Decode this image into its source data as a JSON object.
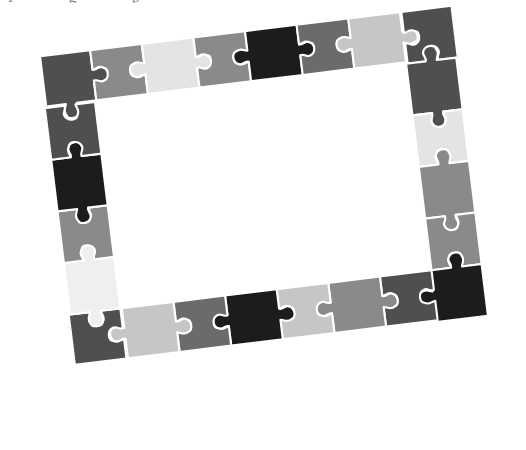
{
  "artwork": {
    "title": "Jigsaw Puzzle Picture Frame",
    "description": "A rectangular picture frame assembled from interlocking jigsaw puzzle pieces, tilted slightly counter-clockwise, rendered in grayscale on a white background with an empty white center.",
    "background_color": "#ffffff",
    "rotation_degrees": -7,
    "piece_outline_color": "#ffffff"
  },
  "page_text": {
    "cut_off_line": "I  g  p"
  },
  "palette": {
    "black": "#1c1c1c",
    "very_dark_gray": "#3a3a3a",
    "dark_gray": "#4f4f4f",
    "mid_dark_gray": "#6b6b6b",
    "mid_gray": "#8a8a8a",
    "light_mid_gray": "#a8a8a8",
    "light_gray": "#c6c6c6",
    "very_light_gray": "#e4e4e4",
    "near_white": "#efefef"
  },
  "frame": {
    "geometry": {
      "columns": 8,
      "rows": 6,
      "piece_size_px": 52,
      "origin_x": 56,
      "origin_y": 30,
      "center_hole": "empty white interior"
    },
    "edges": {
      "top": {
        "label": "Top edge",
        "piece_count": 8,
        "colors": [
          "#4f4f4f",
          "#8a8a8a",
          "#e4e4e4",
          "#8a8a8a",
          "#1c1c1c",
          "#6b6b6b",
          "#c6c6c6",
          "#4f4f4f"
        ]
      },
      "right": {
        "label": "Right edge",
        "piece_count": 6,
        "colors": [
          "#4f4f4f",
          "#e4e4e4",
          "#8a8a8a",
          "#8a8a8a",
          "#1c1c1c",
          "#6b6b6b"
        ]
      },
      "bottom": {
        "label": "Bottom edge",
        "piece_count": 8,
        "colors": [
          "#4f4f4f",
          "#8a8a8a",
          "#c6c6c6",
          "#1c1c1c",
          "#6b6b6b",
          "#c6c6c6",
          "#4f4f4f",
          "#efefef"
        ]
      },
      "left": {
        "label": "Left edge",
        "piece_count": 6,
        "colors": [
          "#efefef",
          "#8a8a8a",
          "#1c1c1c",
          "#4f4f4f",
          "#c6c6c6",
          "#3a3a3a"
        ]
      }
    },
    "corners": {
      "top_left": "#4f4f4f",
      "top_right": "#4f4f4f",
      "bottom_right": "#4f4f4f",
      "bottom_left": "#efefef"
    },
    "total_pieces": 24
  }
}
